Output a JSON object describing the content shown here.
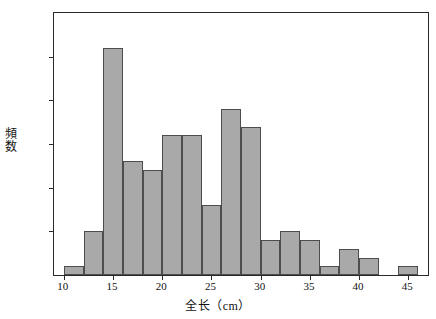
{
  "chart_data": {
    "type": "bar",
    "title": "",
    "subtitle": "",
    "xlabel": "全长（cm）",
    "ylabel": "頻数",
    "xlim": [
      9,
      47
    ],
    "ylim": [
      0,
      30
    ],
    "grid": false,
    "legend": null,
    "bin_width": 2,
    "bar_color": "#a9a9a9",
    "bar_edge_color": "#4d4d4d",
    "xticks": [
      10,
      15,
      20,
      25,
      30,
      35,
      40,
      45
    ],
    "xtick_labels": [
      "10",
      "15",
      "20",
      "25",
      "30",
      "35",
      "40",
      "45"
    ],
    "yticks": [
      0,
      5,
      10,
      15,
      20,
      25,
      30
    ],
    "ytick_labels": [
      "0",
      "5",
      "10",
      "15",
      "20",
      "25",
      "30"
    ],
    "bins": [
      {
        "start": 10,
        "end": 12,
        "value": 1
      },
      {
        "start": 12,
        "end": 14,
        "value": 5
      },
      {
        "start": 14,
        "end": 16,
        "value": 26
      },
      {
        "start": 16,
        "end": 18,
        "value": 13
      },
      {
        "start": 18,
        "end": 20,
        "value": 12
      },
      {
        "start": 20,
        "end": 22,
        "value": 16
      },
      {
        "start": 22,
        "end": 24,
        "value": 16
      },
      {
        "start": 24,
        "end": 26,
        "value": 8
      },
      {
        "start": 26,
        "end": 28,
        "value": 19
      },
      {
        "start": 28,
        "end": 30,
        "value": 17
      },
      {
        "start": 30,
        "end": 32,
        "value": 4
      },
      {
        "start": 32,
        "end": 34,
        "value": 5
      },
      {
        "start": 34,
        "end": 36,
        "value": 4
      },
      {
        "start": 36,
        "end": 38,
        "value": 1
      },
      {
        "start": 38,
        "end": 40,
        "value": 3
      },
      {
        "start": 40,
        "end": 42,
        "value": 2
      },
      {
        "start": 44,
        "end": 46,
        "value": 1
      }
    ],
    "categories": [
      "10-12",
      "12-14",
      "14-16",
      "16-18",
      "18-20",
      "20-22",
      "22-24",
      "24-26",
      "26-28",
      "28-30",
      "30-32",
      "32-34",
      "34-36",
      "36-38",
      "38-40",
      "40-42",
      "44-46"
    ],
    "values": [
      1,
      5,
      26,
      13,
      12,
      16,
      16,
      8,
      19,
      17,
      4,
      5,
      4,
      1,
      3,
      2,
      1
    ]
  }
}
